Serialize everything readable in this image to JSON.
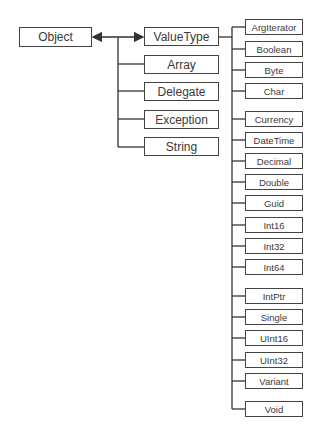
{
  "diagram": {
    "root": {
      "label": "Object",
      "x": 19,
      "y": 27,
      "w": 73,
      "h": 20
    },
    "level1": [
      {
        "label": "ValueType",
        "y": 27
      },
      {
        "label": "Array",
        "y": 55
      },
      {
        "label": "Delegate",
        "y": 82
      },
      {
        "label": "Exception",
        "y": 110
      },
      {
        "label": "String",
        "y": 137
      }
    ],
    "valuetype_children": [
      {
        "label": "ArgIterator",
        "y": 19
      },
      {
        "label": "Boolean",
        "y": 41
      },
      {
        "label": "Byte",
        "y": 62
      },
      {
        "label": "Char",
        "y": 83
      },
      {
        "label": "Currency",
        "y": 111
      },
      {
        "label": "DateTime",
        "y": 132
      },
      {
        "label": "Decimal",
        "y": 153
      },
      {
        "label": "Double",
        "y": 174
      },
      {
        "label": "Guid",
        "y": 195
      },
      {
        "label": "Int16",
        "y": 217
      },
      {
        "label": "Int32",
        "y": 238
      },
      {
        "label": "Int64",
        "y": 259
      },
      {
        "label": "IntPtr",
        "y": 288
      },
      {
        "label": "Single",
        "y": 309
      },
      {
        "label": "UInt16",
        "y": 330
      },
      {
        "label": "UInt32",
        "y": 352
      },
      {
        "label": "Variant",
        "y": 373
      },
      {
        "label": "Void",
        "y": 401
      }
    ]
  }
}
